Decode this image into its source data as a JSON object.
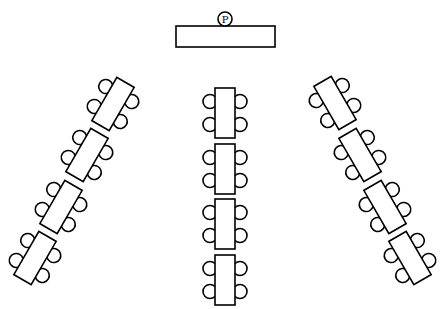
{
  "diagram": {
    "type": "classroom-seating-layout",
    "colors": {
      "line": "#000000",
      "background": "#ffffff"
    },
    "presenter": {
      "label": "P",
      "desk": {
        "x": 176,
        "y": 26,
        "w": 99,
        "h": 21
      },
      "seat": {
        "cx": 225,
        "cy": 19,
        "r": 7
      }
    },
    "table_size": {
      "w": 20,
      "h": 50
    },
    "chair_radius": 7,
    "groups": [
      {
        "name": "left-column",
        "rotation": 30,
        "tables": [
          {
            "cx": 113,
            "cy": 104
          },
          {
            "cx": 87,
            "cy": 155
          },
          {
            "cx": 61,
            "cy": 207
          },
          {
            "cx": 35,
            "cy": 258
          }
        ]
      },
      {
        "name": "center-column",
        "rotation": 0,
        "tables": [
          {
            "cx": 225,
            "cy": 113
          },
          {
            "cx": 225,
            "cy": 169
          },
          {
            "cx": 225,
            "cy": 224
          },
          {
            "cx": 225,
            "cy": 280
          }
        ]
      },
      {
        "name": "right-column",
        "rotation": -30,
        "tables": [
          {
            "cx": 335,
            "cy": 103
          },
          {
            "cx": 360,
            "cy": 155
          },
          {
            "cx": 385,
            "cy": 207
          },
          {
            "cx": 410,
            "cy": 258
          }
        ]
      }
    ],
    "chairs_per_table": 4
  }
}
